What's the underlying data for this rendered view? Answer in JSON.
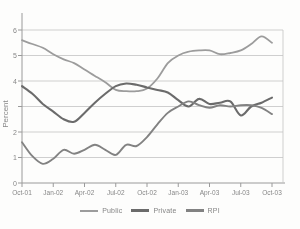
{
  "colors": {
    "background": "#fdfdfc",
    "axis": "#9a9a9a",
    "grid": "#c3c3c3",
    "tick_text": "#878787",
    "public_line": "#9c9c9c",
    "private_line": "#6b6b6b",
    "rpi_line": "#828282"
  },
  "chart_data": {
    "type": "line",
    "title": "",
    "xlabel": "",
    "ylabel": "Percent",
    "ylim": [
      0,
      6
    ],
    "yticks": [
      0,
      1,
      2,
      3,
      4,
      5,
      6
    ],
    "ytick_labels_visible_top_to_bottom": [
      "6",
      "5",
      "4",
      "2",
      "1",
      "0"
    ],
    "ytick_label_3_hidden_behind_axis_title": true,
    "grid": "horizontal",
    "legend_position": "bottom",
    "xtick_labels": [
      "Oct-01",
      "Jan-02",
      "Apr-02",
      "Jul-02",
      "Oct-02",
      "Jan-03",
      "Apr-03",
      "Jul-03",
      "Oct-03"
    ],
    "x_months": [
      "Oct-01",
      "Nov-01",
      "Dec-01",
      "Jan-02",
      "Feb-02",
      "Mar-02",
      "Apr-02",
      "May-02",
      "Jun-02",
      "Jul-02",
      "Aug-02",
      "Sep-02",
      "Oct-02",
      "Nov-02",
      "Dec-02",
      "Jan-03",
      "Feb-03",
      "Mar-03",
      "Apr-03",
      "May-03",
      "Jun-03",
      "Jul-03",
      "Aug-03",
      "Sep-03",
      "Oct-03"
    ],
    "series": [
      {
        "name": "Public",
        "color": "#9c9c9c",
        "values": [
          5.6,
          5.45,
          5.3,
          5.05,
          4.85,
          4.7,
          4.45,
          4.2,
          3.95,
          3.65,
          3.6,
          3.6,
          3.7,
          4.1,
          4.7,
          5.0,
          5.15,
          5.2,
          5.2,
          5.05,
          5.1,
          5.2,
          5.45,
          5.75,
          5.5
        ]
      },
      {
        "name": "Private",
        "color": "#6b6b6b",
        "values": [
          3.8,
          3.5,
          3.1,
          2.8,
          2.5,
          2.4,
          2.75,
          3.15,
          3.5,
          3.8,
          3.9,
          3.85,
          3.75,
          3.65,
          3.55,
          3.25,
          3.0,
          3.3,
          3.1,
          3.15,
          3.2,
          2.65,
          3.0,
          3.15,
          3.35
        ]
      },
      {
        "name": "RPI",
        "color": "#828282",
        "values": [
          1.6,
          1.05,
          0.75,
          0.95,
          1.3,
          1.15,
          1.3,
          1.5,
          1.3,
          1.1,
          1.5,
          1.45,
          1.8,
          2.3,
          2.75,
          3.0,
          3.2,
          3.05,
          2.95,
          3.05,
          3.0,
          3.05,
          3.05,
          2.95,
          2.7
        ]
      }
    ]
  }
}
